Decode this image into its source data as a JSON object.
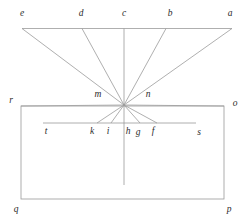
{
  "figure": {
    "width": 248,
    "height": 224,
    "background_color": "#ffffff",
    "line_color": "#9a9a9a",
    "label_color": "#2b2b2b",
    "stroke_width": 0.8
  },
  "geometry": {
    "vertex": {
      "name": "convergence-point",
      "x": 124,
      "y": 105
    },
    "top_line": {
      "name": "line-e-a",
      "x1": 22,
      "y1": 28.5,
      "x2": 232,
      "y2": 28.5
    },
    "mid_line": {
      "name": "line-t-s",
      "x1": 43,
      "y1": 123,
      "x2": 196,
      "y2": 123
    },
    "rectangle": {
      "name": "rect-r-o-p-q",
      "x": 21,
      "y": 106,
      "width": 203,
      "height": 93
    },
    "axis": {
      "name": "vertical-axis",
      "x1": 124,
      "y1": 28.5,
      "x2": 124,
      "y2": 185
    },
    "upper_rays": [
      {
        "to": "e",
        "x": 22,
        "y": 28.5
      },
      {
        "to": "d",
        "x": 82,
        "y": 28.5
      },
      {
        "to": "c",
        "x": 124,
        "y": 28.5
      },
      {
        "to": "b",
        "x": 166,
        "y": 28.5
      },
      {
        "to": "a",
        "x": 232,
        "y": 28.5
      }
    ],
    "lower_rays": [
      {
        "to": "k",
        "x": 97,
        "y": 123
      },
      {
        "to": "i",
        "x": 111,
        "y": 123
      },
      {
        "to": "h",
        "x": 124,
        "y": 123
      },
      {
        "to": "g",
        "x": 140,
        "y": 123
      },
      {
        "to": "f",
        "x": 157,
        "y": 123
      }
    ],
    "corner_rays": [
      {
        "to": "r",
        "x": 21,
        "y": 106
      },
      {
        "to": "o",
        "x": 224,
        "y": 106
      }
    ]
  },
  "labels": [
    {
      "id": "e",
      "text": "e",
      "x": 22,
      "y": 14,
      "role": "top-ray-endpoint"
    },
    {
      "id": "d",
      "text": "d",
      "x": 81,
      "y": 14,
      "role": "top-ray-endpoint"
    },
    {
      "id": "c",
      "text": "c",
      "x": 124,
      "y": 14,
      "role": "top-ray-endpoint"
    },
    {
      "id": "b",
      "text": "b",
      "x": 170,
      "y": 14,
      "role": "top-ray-endpoint"
    },
    {
      "id": "a",
      "text": "a",
      "x": 230,
      "y": 14,
      "role": "top-ray-endpoint"
    },
    {
      "id": "m",
      "text": "m",
      "x": 98,
      "y": 95,
      "role": "vertex-side"
    },
    {
      "id": "n",
      "text": "n",
      "x": 148,
      "y": 95,
      "role": "vertex-side"
    },
    {
      "id": "r",
      "text": "r",
      "x": 11,
      "y": 101,
      "role": "rect-corner"
    },
    {
      "id": "o",
      "text": "o",
      "x": 235,
      "y": 104,
      "role": "rect-corner"
    },
    {
      "id": "t",
      "text": "t",
      "x": 46,
      "y": 132,
      "role": "mid-line-endpoint"
    },
    {
      "id": "k",
      "text": "k",
      "x": 92,
      "y": 132,
      "role": "lower-ray-endpoint"
    },
    {
      "id": "i",
      "text": "i",
      "x": 108,
      "y": 132,
      "role": "lower-ray-endpoint"
    },
    {
      "id": "h",
      "text": "h",
      "x": 128,
      "y": 132,
      "role": "lower-ray-endpoint"
    },
    {
      "id": "g",
      "text": "g",
      "x": 138,
      "y": 133,
      "role": "lower-ray-endpoint"
    },
    {
      "id": "f",
      "text": "f",
      "x": 153,
      "y": 132,
      "role": "lower-ray-endpoint"
    },
    {
      "id": "s",
      "text": "s",
      "x": 199,
      "y": 133,
      "role": "mid-line-endpoint"
    },
    {
      "id": "q",
      "text": "q",
      "x": 16,
      "y": 210,
      "role": "rect-corner"
    },
    {
      "id": "p",
      "text": "p",
      "x": 229,
      "y": 210,
      "role": "rect-corner"
    }
  ]
}
